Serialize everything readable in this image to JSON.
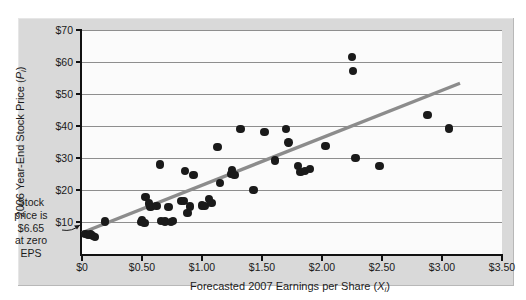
{
  "chart_data": {
    "type": "scatter",
    "title": "",
    "xlabel": "Forecasted 2007 Earnings per Share (Xᵢ)",
    "ylabel": "2006 Year-End Stock Price (Pᵢ)",
    "xlabel_parts": {
      "pre": "Forecasted 2007 Earnings per Share (",
      "var": "X",
      "sub": "i",
      "post": ")"
    },
    "ylabel_parts": {
      "pre": "2006 Year-End Stock Price (",
      "var": "P",
      "sub": "i",
      "post": ")"
    },
    "xlim": [
      0,
      3.5
    ],
    "ylim": [
      0,
      70
    ],
    "xticks": [
      0,
      0.5,
      1.0,
      1.5,
      2.0,
      2.5,
      3.0,
      3.5
    ],
    "xticklabels": [
      "$0",
      "$0.50",
      "$1.00",
      "$1.50",
      "$2.00",
      "$2.50",
      "$3.00",
      "$3.50"
    ],
    "yticks": [
      10,
      20,
      30,
      40,
      50,
      60,
      70
    ],
    "yticklabels": [
      "$10",
      "$20",
      "$30",
      "$40",
      "$50",
      "$60",
      "$70"
    ],
    "grid": "horizontal",
    "legend": "none",
    "marker_color": "#1a1a1a",
    "line_color": "#8c8c8c",
    "panel_color": "#d9d9d9",
    "plot_color": "#fbfbfb",
    "series": [
      {
        "name": "Stocks",
        "points": [
          [
            0.03,
            6.3
          ],
          [
            0.05,
            5.9
          ],
          [
            0.07,
            6.1
          ],
          [
            0.09,
            5.6
          ],
          [
            0.11,
            5.4
          ],
          [
            0.19,
            10.2
          ],
          [
            0.49,
            10.0
          ],
          [
            0.5,
            10.6
          ],
          [
            0.52,
            9.6
          ],
          [
            0.53,
            17.9
          ],
          [
            0.56,
            15.8
          ],
          [
            0.57,
            14.6
          ],
          [
            0.62,
            15.0
          ],
          [
            0.65,
            28.0
          ],
          [
            0.66,
            10.3
          ],
          [
            0.69,
            10.2
          ],
          [
            0.72,
            14.6
          ],
          [
            0.74,
            10.0
          ],
          [
            0.76,
            10.4
          ],
          [
            0.83,
            16.5
          ],
          [
            0.85,
            16.6
          ],
          [
            0.86,
            26.0
          ],
          [
            0.88,
            12.9
          ],
          [
            0.9,
            14.8
          ],
          [
            0.93,
            24.6
          ],
          [
            1.0,
            15.2
          ],
          [
            1.02,
            15.0
          ],
          [
            1.06,
            17.2
          ],
          [
            1.08,
            16.0
          ],
          [
            1.13,
            33.5
          ],
          [
            1.15,
            22.2
          ],
          [
            1.24,
            25.0
          ],
          [
            1.25,
            26.2
          ],
          [
            1.27,
            24.7
          ],
          [
            1.32,
            39.0
          ],
          [
            1.43,
            20.0
          ],
          [
            1.52,
            38.2
          ],
          [
            1.61,
            29.2
          ],
          [
            1.7,
            39.0
          ],
          [
            1.72,
            34.8
          ],
          [
            1.8,
            27.5
          ],
          [
            1.82,
            25.6
          ],
          [
            1.86,
            26.0
          ],
          [
            1.9,
            26.5
          ],
          [
            2.03,
            33.8
          ],
          [
            2.25,
            61.5
          ],
          [
            2.26,
            57.2
          ],
          [
            2.28,
            30.0
          ],
          [
            2.48,
            27.5
          ],
          [
            2.88,
            43.5
          ],
          [
            3.06,
            39.2
          ]
        ]
      }
    ],
    "regression_line": {
      "slope": 14.83,
      "intercept": 6.65,
      "x_start": 0.0,
      "x_end": 3.15,
      "color": "#8c8c8c"
    },
    "annotations": [
      {
        "id": "regression-annotation",
        "lines": [
          "Regression line",
          "with slope = 14.83"
        ],
        "points_to": "regression-line"
      },
      {
        "id": "stock-price-annotation",
        "lines": [
          "Stock",
          "price is",
          "$6.65",
          "at zero",
          "EPS"
        ],
        "points_to": "y-intercept"
      }
    ]
  }
}
